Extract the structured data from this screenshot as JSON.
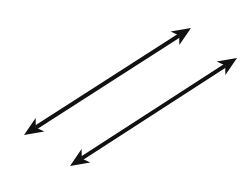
{
  "diagram": {
    "background": "#ffffff",
    "stroke_color": "#111111",
    "stroke_width": 4,
    "lines": [
      {
        "name": "line-1",
        "x1": 24,
        "y1": 135,
        "x2": 191,
        "y2": 28
      },
      {
        "name": "line-2",
        "x1": 70,
        "y1": 166,
        "x2": 237,
        "y2": 58
      }
    ]
  }
}
